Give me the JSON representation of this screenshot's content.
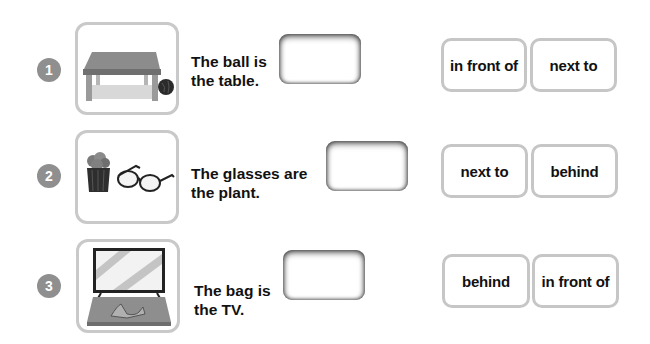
{
  "exercise": {
    "items": [
      {
        "number": "1",
        "image": "table-and-ball-icon",
        "sentence_line1": "The ball is",
        "sentence_line2": "the table.",
        "answer": "",
        "options": [
          "in front of",
          "next to"
        ]
      },
      {
        "number": "2",
        "image": "plant-and-glasses-icon",
        "sentence_line1": "The glasses are",
        "sentence_line2": "the plant.",
        "answer": "",
        "options": [
          "next to",
          "behind"
        ]
      },
      {
        "number": "3",
        "image": "tv-and-bag-icon",
        "sentence_line1": "The bag is",
        "sentence_line2": "the TV.",
        "answer": "",
        "options": [
          "behind",
          "in front of"
        ]
      }
    ]
  },
  "colors": {
    "number_badge": "#8f8f8f",
    "frame_border": "#c9c9c9",
    "option_border": "#c6c6c6",
    "text": "#111111"
  }
}
